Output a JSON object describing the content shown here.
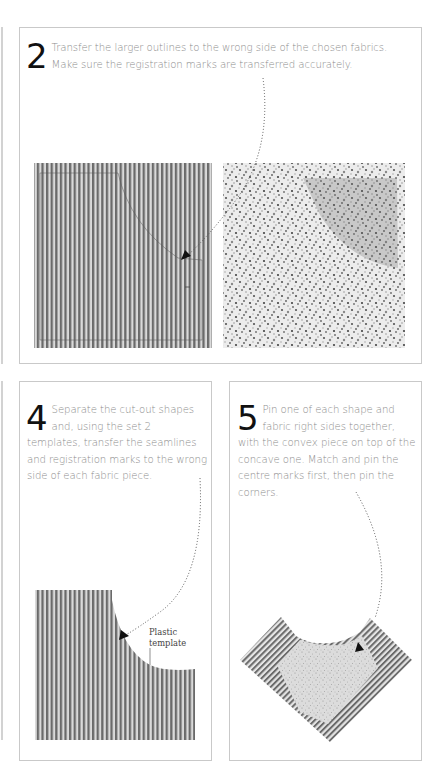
{
  "steps": [
    {
      "number": "2",
      "text": "Transfer the larger outlines to the wrong side of the chosen fabrics. Make sure the registration marks are transferred accurately."
    },
    {
      "number": "4",
      "text": "Separate the cut-out shapes and, using the set 2 templates, transfer the seamlines and registration marks to the wrong side of each fabric piece."
    },
    {
      "number": "5",
      "text": "Pin one of each shape and fabric right sides together, with the convex piece on top of the concave one. Match and pin the centre marks first, then pin the corners."
    }
  ],
  "annotations": {
    "plastic_template": "Plastic template"
  },
  "illustrations": {
    "step2_left": "striped-fabric-with-traced-outline",
    "step2_right": "dotted-fabric-with-traced-outline",
    "step4": "striped-fabric-concave-piece-with-plastic-template",
    "step5": "convex-dotted-piece-pinned-on-concave-striped-piece"
  },
  "colors": {
    "panel_border": "#c9c9c9",
    "body_text": "#8d8d8d",
    "step_number": "#111111",
    "stripe_dark": "#6a6a6a",
    "stripe_light": "#d8d8d8"
  }
}
